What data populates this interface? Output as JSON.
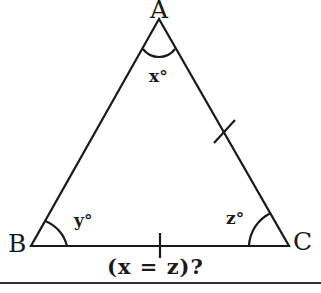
{
  "diagram": {
    "type": "isosceles-triangle",
    "vertices": [
      {
        "id": "A",
        "label": "A",
        "x": 159,
        "y": 19
      },
      {
        "id": "B",
        "label": "B",
        "x": 31,
        "y": 246
      },
      {
        "id": "C",
        "label": "C",
        "x": 289,
        "y": 246
      }
    ],
    "angles": [
      {
        "vertex": "A",
        "label": "x°"
      },
      {
        "vertex": "B",
        "label": "y°"
      },
      {
        "vertex": "C",
        "label": "z°"
      }
    ],
    "congruence_ticks": [
      "AC",
      "BC"
    ],
    "question": "(x = z)?",
    "colors": {
      "stroke": "#1a1a1a",
      "background": "#ffffff"
    }
  }
}
